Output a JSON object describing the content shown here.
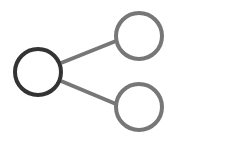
{
  "diagram": {
    "type": "share-tree-icon",
    "root_color": "#333333",
    "child_color": "#777777",
    "nodes": [
      {
        "id": "root",
        "cx": 38,
        "cy": 72,
        "r": 23
      },
      {
        "id": "child-top",
        "cx": 139,
        "cy": 36,
        "r": 23
      },
      {
        "id": "child-bottom",
        "cx": 139,
        "cy": 107,
        "r": 23
      }
    ],
    "edges": [
      {
        "from": "root",
        "to": "child-top"
      },
      {
        "from": "root",
        "to": "child-bottom"
      }
    ]
  }
}
